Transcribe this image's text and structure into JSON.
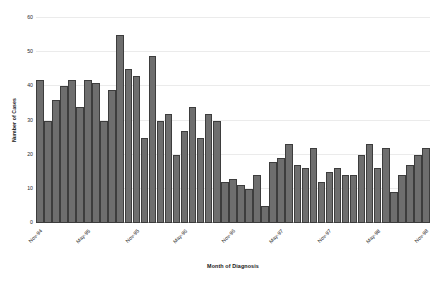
{
  "chart_data": {
    "type": "bar",
    "title": "",
    "xlabel": "Month of Diagnosis",
    "ylabel": "Number of Cases",
    "ylim": [
      0,
      60
    ],
    "ytick_values": [
      0,
      10,
      20,
      30,
      40,
      50,
      60
    ],
    "ytick_labels": [
      "0",
      "10",
      "20",
      "30",
      "40",
      "50",
      "60"
    ],
    "grid": true,
    "legend": "none",
    "bar_color": "#6e6e6e",
    "bar_edge_color": "#3d3d3d",
    "gridline_color": "#ebebeb",
    "axis_color": "#9a9a9a",
    "categories": [
      "Nov-94",
      "Dec-94",
      "Jan-95",
      "Feb-95",
      "Mar-95",
      "Apr-95",
      "May-95",
      "Jun-95",
      "Jul-95",
      "Aug-95",
      "Sep-95",
      "Oct-95",
      "Nov-95",
      "Dec-95",
      "Jan-96",
      "Feb-96",
      "Mar-96",
      "Apr-96",
      "May-96",
      "Jun-96",
      "Jul-96",
      "Aug-96",
      "Sep-96",
      "Oct-96",
      "Nov-96",
      "Dec-96",
      "Jan-97",
      "Feb-97",
      "Mar-97",
      "Apr-97",
      "May-97",
      "Jun-97",
      "Jul-97",
      "Aug-97",
      "Sep-97",
      "Oct-97",
      "Nov-97",
      "Dec-97",
      "Jan-98",
      "Feb-98",
      "Mar-98",
      "Apr-98",
      "May-98",
      "Jun-98",
      "Jul-98",
      "Aug-98",
      "Sep-98",
      "Oct-98",
      "Nov-98"
    ],
    "values": [
      42,
      30,
      36,
      40,
      42,
      34,
      42,
      41,
      30,
      39,
      55,
      45,
      43,
      25,
      49,
      30,
      32,
      20,
      27,
      34,
      25,
      32,
      30,
      12,
      13,
      11,
      10,
      14,
      5,
      18,
      19,
      23,
      17,
      16,
      22,
      12,
      15,
      16,
      14,
      14,
      20,
      23,
      16,
      22,
      9,
      14,
      17,
      20,
      22
    ],
    "xtick_labels": [
      "Nov-94",
      "May-95",
      "Nov-95",
      "May-96",
      "Nov-96",
      "May-97",
      "Nov-97",
      "May-98",
      "Nov-98"
    ],
    "xtick_indices": [
      0,
      6,
      12,
      18,
      24,
      30,
      36,
      42,
      48
    ]
  }
}
